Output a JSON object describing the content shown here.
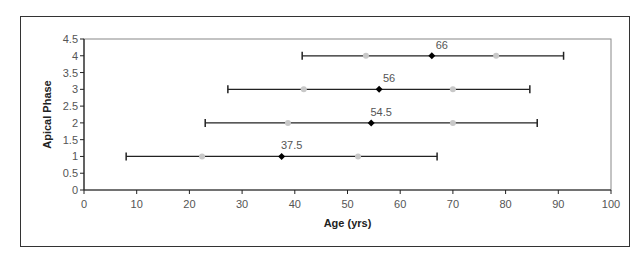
{
  "chart_data": {
    "type": "scatter",
    "title": "",
    "xlabel": "Age (yrs)",
    "ylabel": "Apical Phase",
    "xlim": [
      0,
      100
    ],
    "ylim": [
      0,
      4.5
    ],
    "xticks": [
      0,
      10,
      20,
      30,
      40,
      50,
      60,
      70,
      80,
      90,
      100
    ],
    "yticks": [
      0,
      0.5,
      1,
      1.5,
      2,
      2.5,
      3,
      3.5,
      4,
      4.5
    ],
    "grid": false,
    "legend": null,
    "series": [
      {
        "name": "median",
        "marker": "diamond",
        "color": "#000000",
        "points": [
          {
            "y": 1,
            "x": 37.5,
            "label": "37.5",
            "err_low": 8,
            "err_high": 67
          },
          {
            "y": 2,
            "x": 54.5,
            "label": "54.5",
            "err_low": 23,
            "err_high": 86
          },
          {
            "y": 3,
            "x": 56,
            "label": "56",
            "err_low": 27.3,
            "err_high": 84.6
          },
          {
            "y": 4,
            "x": 66,
            "label": "66",
            "err_low": 41.4,
            "err_high": 91
          }
        ]
      },
      {
        "name": "quartiles",
        "marker": "circle",
        "color": "#c8c8c8",
        "points": [
          {
            "y": 1,
            "x": 22.4
          },
          {
            "y": 1,
            "x": 52
          },
          {
            "y": 2,
            "x": 38.7
          },
          {
            "y": 2,
            "x": 70
          },
          {
            "y": 3,
            "x": 41.7
          },
          {
            "y": 3,
            "x": 70
          },
          {
            "y": 4,
            "x": 53.5
          },
          {
            "y": 4,
            "x": 78.2
          }
        ]
      }
    ]
  },
  "axis": {
    "x_title": "Age (yrs)",
    "y_title": "Apical Phase",
    "x_tick_labels": [
      "0",
      "10",
      "20",
      "30",
      "40",
      "50",
      "60",
      "70",
      "80",
      "90",
      "100"
    ],
    "y_tick_labels": [
      "0",
      "0.5",
      "1",
      "1.5",
      "2",
      "2.5",
      "3",
      "3.5",
      "4",
      "4.5"
    ]
  },
  "colors": {
    "frame": "#333333",
    "plot_border": "#888888",
    "axis": "#222222",
    "median_marker": "#000000",
    "quartile_marker": "#c8c8c8",
    "error_bar": "#222222"
  }
}
